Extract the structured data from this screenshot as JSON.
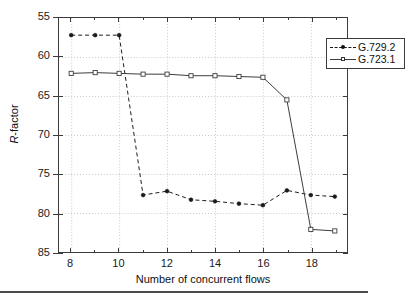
{
  "chart_data": {
    "type": "line",
    "title": "",
    "xlabel": "Number of concurrent flows",
    "ylabel": "R-factor",
    "xlim": [
      7.5,
      19.5
    ],
    "ylim": [
      55,
      85
    ],
    "xticks": [
      8,
      10,
      12,
      14,
      16,
      18
    ],
    "yticks": [
      55,
      60,
      65,
      70,
      75,
      80,
      85
    ],
    "grid": true,
    "legend_position": "top-right",
    "x": [
      8,
      9,
      10,
      11,
      12,
      13,
      14,
      15,
      16,
      17,
      18,
      19
    ],
    "series": [
      {
        "name": "G.729.2",
        "style": "dashed",
        "marker": "dot",
        "color": "#1a1a1a",
        "values": [
          82.8,
          82.8,
          82.8,
          62.3,
          62.8,
          61.7,
          61.5,
          61.2,
          61.0,
          62.9,
          62.3,
          62.1
        ]
      },
      {
        "name": "G.723.1",
        "style": "solid",
        "marker": "square",
        "color": "#3b3b3b",
        "values": [
          77.9,
          78.0,
          77.9,
          77.8,
          77.8,
          77.6,
          77.6,
          77.5,
          77.4,
          74.5,
          57.9,
          57.7
        ]
      }
    ]
  },
  "axis": {
    "y_tick_labels": [
      "85",
      "80",
      "75",
      "70",
      "65",
      "60",
      "55"
    ],
    "x_tick_labels": [
      "8",
      "10",
      "12",
      "14",
      "16",
      "18"
    ],
    "x_title": "Number of concurrent flows",
    "y_title_italic": "R",
    "y_title_rest": "-factor"
  },
  "legend": {
    "entries": [
      {
        "label": "G.729.2"
      },
      {
        "label": "G.723.1"
      }
    ]
  },
  "colors": {
    "axis": "#3b3b3b",
    "grid": "#b9b9b9",
    "series1": "#1a1a1a",
    "series2": "#3b3b3b",
    "background": "#ffffff"
  }
}
